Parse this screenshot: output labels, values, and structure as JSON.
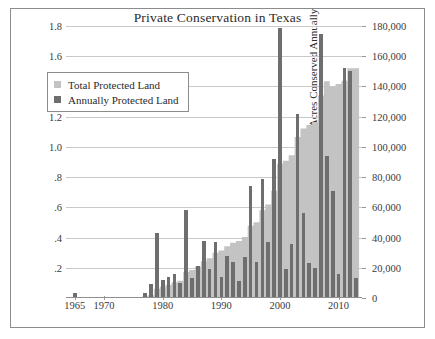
{
  "figure": {
    "title": "Private Conservation in Texas",
    "frame_color": "#8c8c8c"
  },
  "legend": {
    "items": [
      {
        "label": "Total Protected Land",
        "color": "#c3c3c3",
        "swatch": "square-swatch"
      },
      {
        "label": "Annually Protected Land",
        "color": "#6e6e6e",
        "swatch": "square-swatch"
      }
    ]
  },
  "chart_data": {
    "type": "bar",
    "title": "Private Conservation in Texas",
    "xlabel": "",
    "ylabel": "Millions of Cumulative Acres Conserved",
    "ylabel_right": "Acres Conserved Annually",
    "grid": true,
    "legend_position": "upper-left-inside",
    "xlim": [
      1963.5,
      2014.0
    ],
    "ylim": [
      0,
      1.8
    ],
    "ylim_right": [
      0,
      180000
    ],
    "yticks": [
      0.2,
      0.4,
      0.6,
      0.8,
      1.0,
      1.2,
      1.4,
      1.6,
      1.8
    ],
    "ytick_labels": [
      ".2",
      ".4",
      ".6",
      ".8",
      "1.0",
      "1.2",
      "1.4",
      "1.6",
      "1.8"
    ],
    "yticks_right": [
      0,
      20000,
      40000,
      60000,
      80000,
      100000,
      120000,
      140000,
      160000,
      180000
    ],
    "ytick_labels_right": [
      "0",
      "20,000",
      "40,000",
      "60,000",
      "80,000",
      "100,000",
      "120,000",
      "140,000",
      "160,000",
      "180,000"
    ],
    "xticks": [
      1965,
      1970,
      1980,
      1990,
      2000,
      2010
    ],
    "xtick_labels": [
      "1965",
      "1970",
      "1980",
      "1990",
      "2000",
      "2010"
    ],
    "categories": [
      1965,
      1966,
      1967,
      1968,
      1969,
      1970,
      1971,
      1972,
      1973,
      1974,
      1975,
      1976,
      1977,
      1978,
      1979,
      1980,
      1981,
      1982,
      1983,
      1984,
      1985,
      1986,
      1987,
      1988,
      1989,
      1990,
      1991,
      1992,
      1993,
      1994,
      1995,
      1996,
      1997,
      1998,
      1999,
      2000,
      2001,
      2002,
      2003,
      2004,
      2005,
      2006,
      2007,
      2008,
      2009,
      2010,
      2011,
      2012,
      2013
    ],
    "series": [
      {
        "name": "Annually Protected Land",
        "type": "bar",
        "axis": "right",
        "unit": "acres",
        "color": "#6e6e6e",
        "values": [
          3000,
          0,
          0,
          0,
          0,
          0,
          0,
          0,
          0,
          0,
          0,
          0,
          3000,
          9000,
          43000,
          12000,
          14000,
          16000,
          10000,
          58000,
          13000,
          21000,
          38000,
          19000,
          37000,
          14000,
          28000,
          24000,
          11000,
          27000,
          74000,
          24000,
          79000,
          37000,
          92000,
          179000,
          19000,
          36000,
          122000,
          56000,
          23000,
          20000,
          175000,
          94000,
          71000,
          16000,
          152000,
          150000,
          13000
        ]
      },
      {
        "name": "Total Protected Land",
        "type": "area",
        "axis": "left",
        "unit": "millions of acres",
        "color": "#c3c3c3",
        "values": [
          0.003,
          0.003,
          0.003,
          0.003,
          0.003,
          0.003,
          0.004,
          0.004,
          0.005,
          0.005,
          0.006,
          0.007,
          0.01,
          0.019,
          0.062,
          0.074,
          0.088,
          0.104,
          0.114,
          0.172,
          0.185,
          0.206,
          0.244,
          0.263,
          0.3,
          0.314,
          0.342,
          0.366,
          0.377,
          0.404,
          0.478,
          0.502,
          0.581,
          0.618,
          0.71,
          0.889,
          0.908,
          0.944,
          1.066,
          1.122,
          1.145,
          1.165,
          1.34,
          1.434,
          1.4,
          1.416,
          1.437,
          1.52,
          1.52
        ]
      }
    ]
  }
}
